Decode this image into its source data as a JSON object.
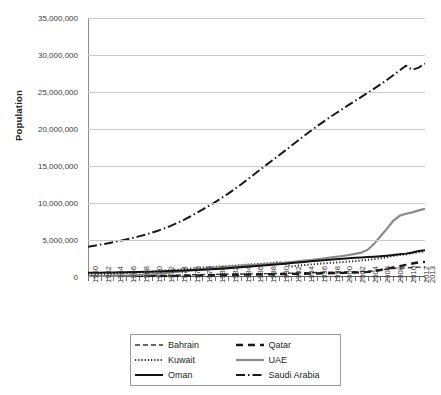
{
  "chart_data": {
    "type": "line",
    "title": "",
    "xlabel": "Year",
    "ylabel": "Population",
    "ylim": [
      0,
      35000000
    ],
    "ytick_labels": [
      "0",
      "5,000,000",
      "10,000,000",
      "15,000,000",
      "20,000,000",
      "25,000,000",
      "30,000,000",
      "35,000,000"
    ],
    "ytick_values": [
      0,
      5000000,
      10000000,
      15000000,
      20000000,
      25000000,
      30000000,
      35000000
    ],
    "grid": true,
    "legend_position": "bottom",
    "xlim": [
      1960,
      2013
    ],
    "x": [
      1960,
      1961,
      1962,
      1963,
      1964,
      1965,
      1966,
      1967,
      1968,
      1969,
      1970,
      1971,
      1972,
      1973,
      1974,
      1975,
      1976,
      1977,
      1978,
      1979,
      1980,
      1981,
      1982,
      1983,
      1984,
      1985,
      1986,
      1987,
      1988,
      1989,
      1990,
      1991,
      1992,
      1993,
      1994,
      1995,
      1996,
      1997,
      1998,
      1999,
      2000,
      2001,
      2002,
      2003,
      2004,
      2005,
      2006,
      2007,
      2008,
      2009,
      2010,
      2011,
      2012,
      2013
    ],
    "xtick_labels": [
      "1960",
      "1962",
      "1964",
      "1966",
      "1968",
      "1970",
      "1972",
      "1974",
      "1976",
      "1978",
      "1980",
      "1982",
      "1984",
      "1986",
      "1988",
      "1990",
      "1992",
      "1994",
      "1996",
      "1998",
      "2000",
      "2002",
      "2004",
      "2006",
      "2008",
      "2010",
      "2012",
      "2013"
    ],
    "series": [
      {
        "name": "Bahrain",
        "style": "dashed",
        "color": "#3a3a3a",
        "width": 1.4,
        "values": [
          162000,
          170000,
          178000,
          186000,
          194000,
          202000,
          210000,
          218000,
          225000,
          232000,
          220000,
          227000,
          236000,
          246000,
          258000,
          272000,
          288000,
          306000,
          325000,
          343000,
          358000,
          371000,
          383000,
          395000,
          406000,
          417000,
          428000,
          440000,
          452000,
          466000,
          483000,
          502000,
          523000,
          544000,
          565000,
          586000,
          606000,
          626000,
          645000,
          664000,
          681000,
          698000,
          716000,
          737000,
          762000,
          830000,
          940000,
          1050000,
          1150000,
          1200000,
          1240000,
          1290000,
          1330000,
          1350000
        ]
      },
      {
        "name": "Qatar",
        "style": "dashed-bold",
        "color": "#1a1a1a",
        "width": 2.4,
        "values": [
          47000,
          50000,
          54000,
          58000,
          63000,
          68000,
          74000,
          80000,
          87000,
          94000,
          102000,
          112000,
          123000,
          136000,
          151000,
          167000,
          185000,
          203000,
          221000,
          238000,
          254000,
          269000,
          283000,
          296000,
          309000,
          322000,
          335000,
          348000,
          362000,
          376000,
          390000,
          404000,
          418000,
          433000,
          449000,
          465000,
          481000,
          499000,
          516000,
          534000,
          552000,
          572000,
          597000,
          633000,
          698000,
          804000,
          948000,
          1115000,
          1280000,
          1450000,
          1640000,
          1830000,
          1970000,
          2050000
        ]
      },
      {
        "name": "Kuwait",
        "style": "dotted",
        "color": "#2a2a2a",
        "width": 2.0,
        "values": [
          270000,
          300000,
          340000,
          380000,
          420000,
          470000,
          520000,
          570000,
          620000,
          670000,
          740000,
          800000,
          860000,
          920000,
          980000,
          1050000,
          1130000,
          1210000,
          1280000,
          1340000,
          1380000,
          1430000,
          1490000,
          1550000,
          1610000,
          1670000,
          1720000,
          1780000,
          1840000,
          1890000,
          2050000,
          1780000,
          1420000,
          1540000,
          1610000,
          1680000,
          1760000,
          1840000,
          1900000,
          1960000,
          2010000,
          2080000,
          2150000,
          2230000,
          2320000,
          2420000,
          2540000,
          2680000,
          2830000,
          2970000,
          3050000,
          3200000,
          3350000,
          3430000
        ]
      },
      {
        "name": "UAE",
        "style": "solid-gray",
        "color": "#8a8a8a",
        "width": 2.2,
        "values": [
          92000,
          104000,
          118000,
          134000,
          152000,
          174000,
          200000,
          232000,
          270000,
          315000,
          370000,
          440000,
          520000,
          610000,
          700000,
          800000,
          900000,
          1000000,
          1090000,
          1170000,
          1240000,
          1310000,
          1380000,
          1440000,
          1500000,
          1560000,
          1620000,
          1680000,
          1740000,
          1800000,
          1860000,
          1940000,
          2030000,
          2120000,
          2210000,
          2300000,
          2400000,
          2500000,
          2610000,
          2720000,
          2840000,
          2970000,
          3120000,
          3300000,
          3690000,
          4480000,
          5500000,
          6500000,
          7600000,
          8270000,
          8550000,
          8740000,
          9000000,
          9200000
        ]
      },
      {
        "name": "Oman",
        "style": "solid-black",
        "color": "#111111",
        "width": 2.0,
        "values": [
          558000,
          570000,
          583000,
          597000,
          612000,
          628000,
          645000,
          663000,
          682000,
          703000,
          724000,
          748000,
          773000,
          800000,
          830000,
          862000,
          898000,
          937000,
          980000,
          1026000,
          1075000,
          1128000,
          1184000,
          1243000,
          1305000,
          1370000,
          1437000,
          1506000,
          1577000,
          1650000,
          1725000,
          1802000,
          1880000,
          1958000,
          2036000,
          2113000,
          2189000,
          2263000,
          2334000,
          2402000,
          2467000,
          2528000,
          2586000,
          2640000,
          2693000,
          2747000,
          2806000,
          2875000,
          2960000,
          3060000,
          3160000,
          3300000,
          3500000,
          3630000
        ]
      },
      {
        "name": "Saudi Arabia",
        "style": "dash-dot",
        "color": "#1a1a1a",
        "width": 2.0,
        "values": [
          4090000,
          4230000,
          4380000,
          4540000,
          4710000,
          4890000,
          5080000,
          5280000,
          5490000,
          5720000,
          5980000,
          6260000,
          6570000,
          6910000,
          7290000,
          7700000,
          8140000,
          8610000,
          9100000,
          9610000,
          10130000,
          10670000,
          11240000,
          11840000,
          12470000,
          13120000,
          13790000,
          14460000,
          15120000,
          15770000,
          16420000,
          17080000,
          17750000,
          18420000,
          19080000,
          19730000,
          20360000,
          20970000,
          21560000,
          22130000,
          22690000,
          23250000,
          23800000,
          24350000,
          24900000,
          25460000,
          26040000,
          26630000,
          27260000,
          27900000,
          28550000,
          28000000,
          28290000,
          28830000
        ]
      }
    ]
  },
  "legend": {
    "items": [
      {
        "label": "Bahrain",
        "swatch": "dashed-line-icon"
      },
      {
        "label": "Qatar",
        "swatch": "dashed-bold-line-icon"
      },
      {
        "label": "Kuwait",
        "swatch": "dotted-line-icon"
      },
      {
        "label": "UAE",
        "swatch": "solid-gray-line-icon"
      },
      {
        "label": "Oman",
        "swatch": "solid-black-line-icon"
      },
      {
        "label": "Saudi Arabia",
        "swatch": "dash-dot-line-icon"
      }
    ]
  },
  "caption": ""
}
